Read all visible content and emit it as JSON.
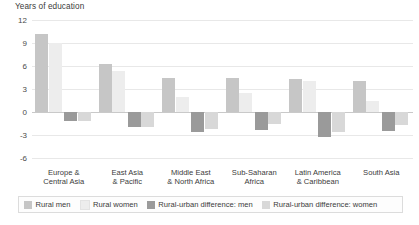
{
  "chart_data": {
    "type": "bar",
    "title": "Years of education",
    "ylabel": "Years of education",
    "xlabel": "",
    "ylim": [
      -6,
      12
    ],
    "yticks": [
      12,
      9,
      6,
      3,
      0,
      -3,
      -6
    ],
    "grid": true,
    "legend_position": "bottom",
    "categories": [
      "Europe &\nCentral Asia",
      "East Asia\n& Pacific",
      "Middle East\n& North Africa",
      "Sub-Saharan\nAfrica",
      "Latin America\n& Caribbean",
      "South Asia"
    ],
    "series": [
      {
        "name": "Rural men",
        "color": "#c6c6c6",
        "values": [
          10.2,
          6.3,
          4.5,
          4.4,
          4.3,
          4.0
        ]
      },
      {
        "name": "Rural women",
        "color": "#ededed",
        "values": [
          9.0,
          5.4,
          2.0,
          2.5,
          4.1,
          1.5
        ]
      },
      {
        "name": "Rural-urban difference: men",
        "color": "#9a9a9a",
        "values": [
          -1.2,
          -2.0,
          -2.6,
          -2.3,
          -3.2,
          -2.5
        ]
      },
      {
        "name": "Rural-urban difference: women",
        "color": "#d8d8d8",
        "values": [
          -1.2,
          -2.0,
          -2.2,
          -1.6,
          -2.6,
          -1.7
        ]
      }
    ]
  },
  "categories_display": [
    {
      "line1": "Europe &",
      "line2": "Central Asia"
    },
    {
      "line1": "East Asia",
      "line2": "& Pacific"
    },
    {
      "line1": "Middle East",
      "line2": "& North Africa"
    },
    {
      "line1": "Sub-Saharan",
      "line2": "Africa"
    },
    {
      "line1": "Latin America",
      "line2": "& Caribbean"
    },
    {
      "line1": "South Asia",
      "line2": ""
    }
  ],
  "ytick_labels": [
    "12",
    "9",
    "6",
    "3",
    "0",
    "-3",
    "-6"
  ],
  "legend": [
    {
      "label": "Rural men",
      "color": "#c6c6c6"
    },
    {
      "label": "Rural women",
      "color": "#ededed"
    },
    {
      "label": "Rural-urban difference: men",
      "color": "#9a9a9a"
    },
    {
      "label": "Rural-urban difference: women",
      "color": "#d8d8d8"
    }
  ],
  "colors": {
    "grid": "#e8e8e8",
    "zero_line": "#c9c9c9",
    "text": "#3b3b3b",
    "legend_border": "#dcdcdc"
  }
}
